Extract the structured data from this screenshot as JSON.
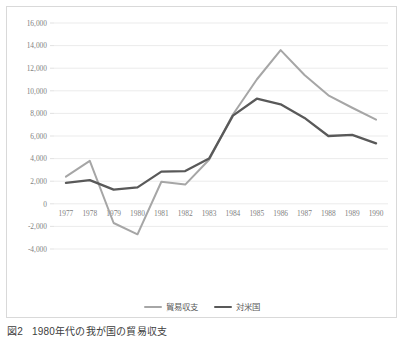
{
  "figure": {
    "caption_number": "図2",
    "caption_text": "1980年代の我が国の貿易収支"
  },
  "colors": {
    "series_trade_balance": "#a6a6a6",
    "series_us": "#595959",
    "gridline": "#e6e6e6",
    "frame_border": "#d9d9d9",
    "tick_label": "#7f7f7f",
    "background": "#ffffff"
  },
  "legend": {
    "position": "bottom",
    "entries": [
      {
        "label": "貿易収支",
        "color": "#a6a6a6"
      },
      {
        "label": "対米国",
        "color": "#595959"
      }
    ]
  },
  "axes": {
    "y_tick_labels": [
      "16,000",
      "14,000",
      "12,000",
      "10,000",
      "8,000",
      "6,000",
      "4,000",
      "2,000",
      "0",
      "-2,000",
      "-4,000"
    ],
    "x_tick_labels": [
      "1977",
      "1978",
      "1979",
      "1980",
      "1981",
      "1982",
      "1983",
      "1984",
      "1985",
      "1986",
      "1987",
      "1988",
      "1989",
      "1990"
    ]
  },
  "chart_data": {
    "type": "line",
    "title": "1980年代の我が国の貿易収支",
    "xlabel": "",
    "ylabel": "",
    "ylim": [
      -4000,
      16000
    ],
    "ytick_step": 2000,
    "grid": true,
    "legend_position": "bottom",
    "categories": [
      "1977",
      "1978",
      "1979",
      "1980",
      "1981",
      "1982",
      "1983",
      "1984",
      "1985",
      "1986",
      "1987",
      "1988",
      "1989",
      "1990"
    ],
    "series": [
      {
        "name": "貿易収支",
        "color": "#a6a6a6",
        "values": [
          2400,
          3800,
          -1700,
          -2700,
          1950,
          1700,
          3900,
          7900,
          11000,
          13600,
          11400,
          9600,
          8500,
          7450
        ]
      },
      {
        "name": "対米国",
        "color": "#595959",
        "values": [
          1850,
          2100,
          1250,
          1450,
          2850,
          2900,
          4000,
          7800,
          9300,
          8800,
          7600,
          6000,
          6100,
          5350
        ]
      }
    ]
  }
}
